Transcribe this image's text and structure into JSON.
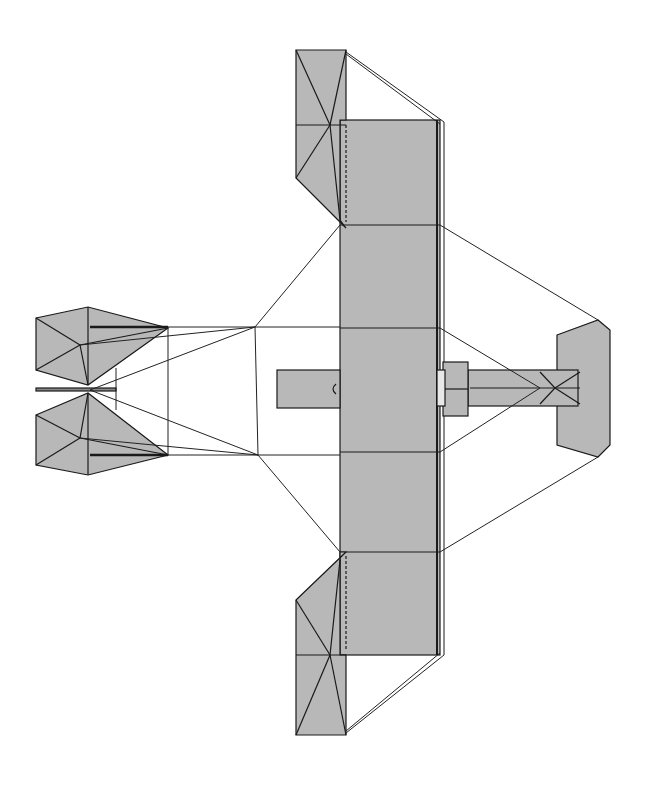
{
  "figure": {
    "type": "technical-plan-view",
    "orientation": "nose left, tail right",
    "colors": {
      "background": "#ffffff",
      "surface_fill": "#b8b8b8",
      "line": "#1a1a1a",
      "rigging": "#333333"
    }
  },
  "components": {
    "main_wing": {
      "label": "",
      "bays": 5
    },
    "wingtip_ailerons": {
      "count": 2
    },
    "front_elevator": {
      "count": 2
    },
    "tail_surfaces": {
      "horizontal_stabilizer": 1
    },
    "center_fin": 1,
    "engine_mount": 1
  }
}
